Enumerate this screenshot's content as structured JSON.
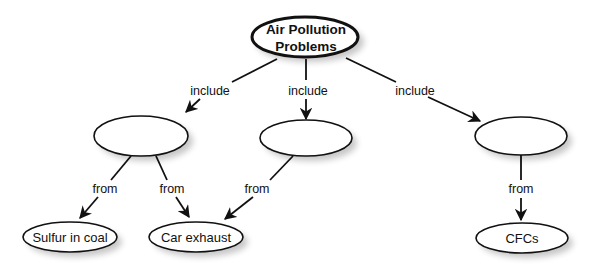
{
  "diagram": {
    "type": "concept-map",
    "root": {
      "id": "root",
      "label_line1": "Air Pollution",
      "label_line2": "Problems"
    },
    "nodes": [
      {
        "id": "n1",
        "label": ""
      },
      {
        "id": "n2",
        "label": ""
      },
      {
        "id": "n3",
        "label": ""
      },
      {
        "id": "s1",
        "label": "Sulfur in coal"
      },
      {
        "id": "s2",
        "label": "Car exhaust"
      },
      {
        "id": "s3",
        "label": "CFCs"
      }
    ],
    "edges": [
      {
        "from": "root",
        "to": "n1",
        "label": "include"
      },
      {
        "from": "root",
        "to": "n2",
        "label": "include"
      },
      {
        "from": "root",
        "to": "n3",
        "label": "include"
      },
      {
        "from": "n1",
        "to": "s1",
        "label": "from"
      },
      {
        "from": "n1",
        "to": "s2",
        "label": "from"
      },
      {
        "from": "n2",
        "to": "s2",
        "label": "from"
      },
      {
        "from": "n3",
        "to": "s3",
        "label": "from"
      }
    ]
  },
  "colors": {
    "stroke": "#111111",
    "fill": "#ffffff",
    "background": "#ffffff"
  }
}
